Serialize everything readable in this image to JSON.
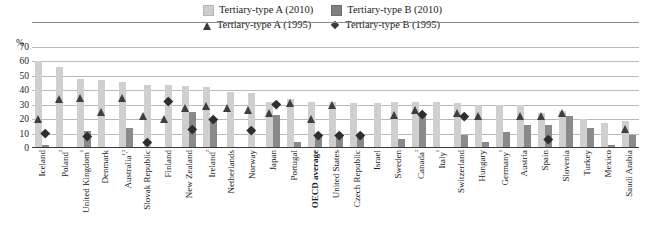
{
  "legend": {
    "items": [
      {
        "marker": "square-light",
        "label": "Tertiary-type A (2010)"
      },
      {
        "marker": "square-dark",
        "label": "Tertiary-type B (2010)"
      },
      {
        "marker": "triangle",
        "label": "Tertiary-type A (1995)"
      },
      {
        "marker": "diamond",
        "label": "Tertiary-type B (1995)"
      }
    ]
  },
  "axis": {
    "unit": "%",
    "yticks": [
      "0",
      "10",
      "20",
      "30",
      "40",
      "50",
      "60",
      "70"
    ]
  },
  "colors": {
    "bar_light": "#cfcfcf",
    "bar_dark": "#8a8a8a",
    "marker": "#3f3f3f",
    "gridline": "#b9b9b9",
    "text": "#1a1a1a"
  },
  "chart_data": {
    "type": "bar",
    "title": "",
    "xlabel": "",
    "ylabel": "%",
    "ylim": [
      0,
      70
    ],
    "ytick_step": 10,
    "grid": true,
    "legend_position": "top-center",
    "categories": [
      "Iceland",
      "Poland²",
      "United Kingdom¹",
      "Denmark",
      "Australia¹,²",
      "Slovak Republic",
      "Finland",
      "New Zealand",
      "Ireland²",
      "Netherlands",
      "Norway",
      "Japan",
      "Portugal",
      "OECD average",
      "United States",
      "Czech Republic",
      "Israel",
      "Sweden",
      "Canada²",
      "Italy¹",
      "Switzerland",
      "Hungary",
      "Germany¹",
      "Austria",
      "Spain",
      "Slovenia",
      "Turkey",
      "Mexico",
      "Saudi Arabia"
    ],
    "series": [
      {
        "name": "Tertiary-type A (2010)",
        "type": "bar",
        "color": "#cfcfcf",
        "values": [
          60,
          56,
          48,
          47,
          46,
          44,
          44,
          43,
          42,
          39,
          38,
          32,
          34,
          32,
          32,
          31,
          31,
          32,
          32,
          32,
          31,
          30,
          30,
          30,
          24,
          26,
          20,
          17,
          19
        ]
      },
      {
        "name": "Tertiary-type B (2010)",
        "type": "bar",
        "color": "#8a8a8a",
        "values": [
          2,
          1,
          12,
          1,
          14,
          0,
          0,
          25,
          20,
          0,
          0,
          23,
          4,
          10,
          10,
          9,
          0,
          6,
          24,
          1,
          9,
          4,
          11,
          16,
          16,
          22,
          14,
          2,
          9
        ]
      },
      {
        "name": "Tertiary-type A (1995)",
        "type": "marker-triangle",
        "color": "#3f3f3f",
        "values": [
          20,
          34,
          35,
          25,
          35,
          22,
          20,
          28,
          29,
          28,
          26,
          24,
          31,
          20,
          30,
          null,
          null,
          23,
          26,
          null,
          24,
          22,
          null,
          22,
          22,
          24,
          null,
          null,
          13
        ]
      },
      {
        "name": "Tertiary-type B (1995)",
        "type": "marker-diamond",
        "color": "#2e2e2e",
        "values": [
          10,
          null,
          8,
          null,
          null,
          4,
          32,
          13,
          20,
          null,
          12,
          30,
          null,
          9,
          9,
          9,
          null,
          null,
          23,
          null,
          22,
          null,
          null,
          null,
          6,
          null,
          null,
          null,
          null
        ]
      }
    ]
  }
}
